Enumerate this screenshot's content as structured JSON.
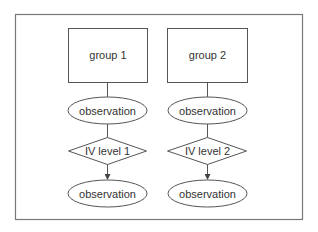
{
  "diagram": {
    "colors": {
      "stroke": "#555555",
      "frame": "#777777",
      "text": "#333333",
      "background": "#ffffff"
    },
    "columns": [
      {
        "group_label": "group 1",
        "observation_top": "observation",
        "iv_label": "IV level 1",
        "observation_bottom": "observation"
      },
      {
        "group_label": "group 2",
        "observation_top": "observation",
        "iv_label": "IV level 2",
        "observation_bottom": "observation"
      }
    ]
  }
}
